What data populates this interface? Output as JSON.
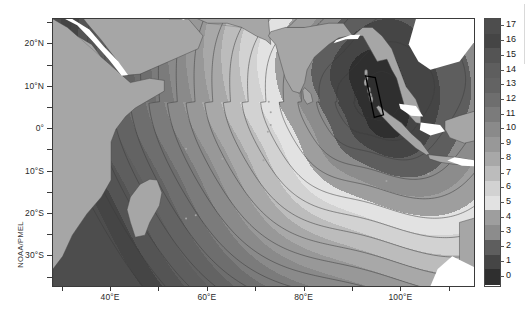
{
  "figure": {
    "credit": "NOAA/PMEL",
    "background": "#ffffff",
    "frame_color": "#3a3a3a"
  },
  "axes": {
    "x_tick_labels": [
      "40°E",
      "60°E",
      "80°E",
      "100°E"
    ],
    "x_tick_values": [
      40,
      60,
      80,
      100
    ],
    "x_minor_ticks": [
      30,
      40,
      50,
      60,
      70,
      80,
      90,
      100,
      110
    ],
    "y_tick_labels": [
      "20°N",
      "10°N",
      "0°",
      "10°S",
      "20°S",
      "30°S"
    ],
    "y_tick_values": [
      20,
      10,
      0,
      -10,
      -20,
      -30
    ],
    "y_minor_ticks": [
      25,
      20,
      15,
      10,
      5,
      0,
      -5,
      -10,
      -15,
      -20,
      -25,
      -30,
      -35
    ]
  },
  "colorbar": {
    "labels": [
      "17",
      "16",
      "15",
      "14",
      "13",
      "12",
      "11",
      "10",
      "9",
      "8",
      "7",
      "6",
      "5",
      "4",
      "3",
      "2",
      "1",
      "0"
    ],
    "values": [
      17,
      16,
      15,
      14,
      13,
      12,
      11,
      10,
      9,
      8,
      7,
      6,
      5,
      4,
      3,
      2,
      1,
      0
    ],
    "colors": [
      "#4d4d4d",
      "#454545",
      "#545454",
      "#5e5e5e",
      "#636363",
      "#6e6e6e",
      "#7b7b7b",
      "#8a8a8a",
      "#989898",
      "#a8a8a8",
      "#bcbcbc",
      "#d2d2d2",
      "#e2e2e2",
      "#9e9e9e",
      "#8c8c8c",
      "#5e5e5e",
      "#454545",
      "#2f2f2f"
    ],
    "min": 0,
    "max": 17,
    "orientation": "vertical"
  },
  "chart_data": {
    "type": "heatmap",
    "title": "",
    "subtitle": "",
    "xlabel": "",
    "ylabel": "",
    "xlim": [
      28,
      115
    ],
    "ylim": [
      -37,
      26
    ],
    "grid": false,
    "legend_position": "right",
    "colorbar_label": "",
    "contour_levels": [
      0,
      1,
      2,
      3,
      4,
      5,
      6,
      7,
      8,
      9,
      10,
      11,
      12,
      13,
      14,
      15,
      16,
      17
    ],
    "annotations": [
      "NOAA/PMEL"
    ],
    "source_region": {
      "label": "rupture-source-polygon",
      "approx_lon": [
        93.2,
        92.0,
        94.6,
        96.4
      ],
      "approx_lat": [
        12.5,
        7.8,
        2.2,
        4.8
      ]
    },
    "series": [
      {
        "name": "travel_time_hours",
        "values": [
          0,
          1,
          2,
          3,
          4,
          5,
          6,
          7,
          8,
          9,
          10,
          11,
          12,
          13,
          14,
          15,
          16,
          17
        ]
      }
    ]
  }
}
